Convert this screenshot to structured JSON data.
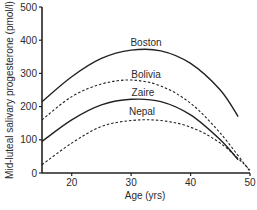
{
  "chart_data": {
    "type": "line",
    "title": "",
    "xlabel": "Age (yrs)",
    "ylabel": "Mid-luteal salivary progesterone (pmol/l)",
    "xlim": [
      15,
      50
    ],
    "ylim": [
      0,
      500
    ],
    "xticks": [
      20,
      30,
      40,
      50
    ],
    "yticks": [
      0,
      100,
      200,
      300,
      400,
      500
    ],
    "grid": false,
    "legend": "inline labels above curves",
    "series": [
      {
        "name": "Boston",
        "style": "solid",
        "x": [
          15,
          20,
          25,
          30,
          35,
          40,
          45,
          48
        ],
        "y": [
          215,
          290,
          345,
          370,
          368,
          330,
          250,
          170
        ]
      },
      {
        "name": "Bolivia",
        "style": "dashed",
        "x": [
          15,
          20,
          25,
          30,
          35,
          40,
          45,
          50
        ],
        "y": [
          160,
          230,
          268,
          280,
          262,
          210,
          120,
          5
        ]
      },
      {
        "name": "Zaire",
        "style": "solid",
        "x": [
          15,
          20,
          25,
          30,
          35,
          40,
          45,
          48
        ],
        "y": [
          95,
          160,
          205,
          222,
          215,
          175,
          100,
          40
        ]
      },
      {
        "name": "Nepal",
        "style": "dashed",
        "x": [
          15,
          20,
          25,
          30,
          35,
          40,
          45,
          50
        ],
        "y": [
          25,
          90,
          140,
          158,
          158,
          138,
          90,
          10
        ]
      }
    ]
  },
  "labels": {
    "xlabel": "Age (yrs)",
    "ylabel": "Mid-luteal salivary progesterone (pmol/l)",
    "series_labels": [
      "Boston",
      "Bolivia",
      "Zaire",
      "Nepal"
    ]
  }
}
